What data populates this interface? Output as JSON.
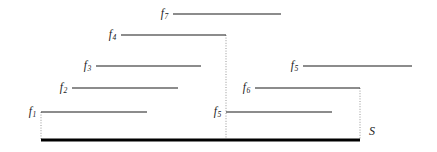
{
  "figure": {
    "type": "interval-stabbing-diagram",
    "background_color": "#ffffff",
    "segment_color": "#1a1a1a",
    "baseline_color": "#000000",
    "dotted_color": "#8a8a8a",
    "width": 437,
    "height": 152
  },
  "segments": [
    {
      "id": "f7",
      "label_text": "f",
      "label_sub": "7",
      "x1": 173,
      "x2": 281,
      "y": 14,
      "label_x": 168,
      "label_y": 14
    },
    {
      "id": "f4",
      "label_text": "f",
      "label_sub": "4",
      "x1": 121,
      "x2": 226,
      "y": 35,
      "label_x": 116,
      "label_y": 35
    },
    {
      "id": "f3",
      "label_text": "f",
      "label_sub": "3",
      "x1": 96,
      "x2": 201,
      "y": 66,
      "label_x": 91,
      "label_y": 66
    },
    {
      "id": "f5-right",
      "label_text": "f",
      "label_sub": "5",
      "x1": 303,
      "x2": 412,
      "y": 66,
      "label_x": 298,
      "label_y": 66
    },
    {
      "id": "f2",
      "label_text": "f",
      "label_sub": "2",
      "x1": 72,
      "x2": 178,
      "y": 88,
      "label_x": 67,
      "label_y": 88
    },
    {
      "id": "f6",
      "label_text": "f",
      "label_sub": "6",
      "x1": 255,
      "x2": 360,
      "y": 88,
      "label_x": 250,
      "label_y": 88
    },
    {
      "id": "f1",
      "label_text": "f",
      "label_sub": "1",
      "x1": 41,
      "x2": 147,
      "y": 112,
      "label_x": 36,
      "label_y": 112
    },
    {
      "id": "f5-lower",
      "label_text": "f",
      "label_sub": "5",
      "x1": 226,
      "x2": 332,
      "y": 112,
      "label_x": 221,
      "label_y": 112
    }
  ],
  "drop_lines": [
    {
      "id": "drop-left",
      "x": 41,
      "y1": 112,
      "y2": 140
    },
    {
      "id": "drop-middle",
      "x": 226,
      "y1": 35,
      "y2": 140
    },
    {
      "id": "drop-right",
      "x": 360,
      "y1": 88,
      "y2": 140
    }
  ],
  "baseline": {
    "x1": 41,
    "x2": 360,
    "y": 140
  },
  "surface": {
    "label": "S",
    "label_x": 369,
    "label_y": 131
  }
}
